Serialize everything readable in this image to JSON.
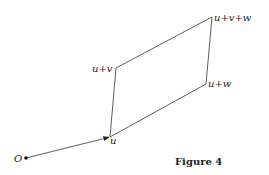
{
  "figure": {
    "caption": "Figure 4",
    "points": {
      "origin": {
        "label": "O",
        "x": 26,
        "y": 158
      },
      "u": {
        "label": "u",
        "x": 110,
        "y": 137
      },
      "u_plus_v": {
        "label": "u+v",
        "x": 116,
        "y": 68
      },
      "u_plus_v_plus_w": {
        "label": "u+v+w",
        "x": 212,
        "y": 17
      },
      "u_plus_w": {
        "label": "u+w",
        "x": 206,
        "y": 84
      }
    },
    "line_color": "#333333"
  }
}
